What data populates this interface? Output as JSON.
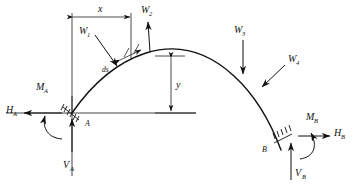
{
  "figure": {
    "background_color": "#ffffff",
    "line_color": "#111111",
    "width": 361,
    "height": 187
  },
  "supports": [
    {
      "id": "A",
      "label": "A",
      "type": "fixed-support-hatched",
      "x": 72,
      "y": 113
    },
    {
      "id": "B",
      "label": "B",
      "type": "fixed-support-hatched",
      "x": 281,
      "y": 150
    }
  ],
  "reactions": {
    "A": {
      "horizontal": {
        "label": "H",
        "sub": "A",
        "direction": "left"
      },
      "vertical": {
        "label": "V",
        "sub": "A",
        "direction": "up"
      },
      "moment": {
        "label": "M",
        "sub": "A",
        "direction": "counterclockwise"
      }
    },
    "B": {
      "horizontal": {
        "label": "H",
        "sub": "B",
        "direction": "right"
      },
      "vertical": {
        "label": "V",
        "sub": "B",
        "direction": "up"
      },
      "moment": {
        "label": "M",
        "sub": "B",
        "direction": "clockwise"
      }
    }
  },
  "loads": [
    {
      "id": "W1",
      "label": "W",
      "sub": "1",
      "direction": "down-right",
      "note": "inclined load on left haunch"
    },
    {
      "id": "W2",
      "label": "W",
      "sub": "2",
      "direction": "up",
      "note": "upward load near crown-left"
    },
    {
      "id": "W3",
      "label": "W",
      "sub": "3",
      "direction": "down",
      "note": "vertical load on right haunch"
    },
    {
      "id": "W4",
      "label": "W",
      "sub": "4",
      "direction": "down-left",
      "note": "inclined load on right haunch"
    }
  ],
  "dimensions": [
    {
      "id": "x",
      "label": "x",
      "orientation": "horizontal",
      "note": "distance from A to element ds"
    },
    {
      "id": "y",
      "label": "y",
      "orientation": "vertical",
      "note": "rise of arch at section"
    },
    {
      "id": "ds",
      "label": "ds",
      "orientation": "along-curve",
      "note": "differential arch length element"
    }
  ],
  "axes": {
    "baseline": "horizontal reference line through support A",
    "vertical_reference": "vertical line through support A"
  }
}
